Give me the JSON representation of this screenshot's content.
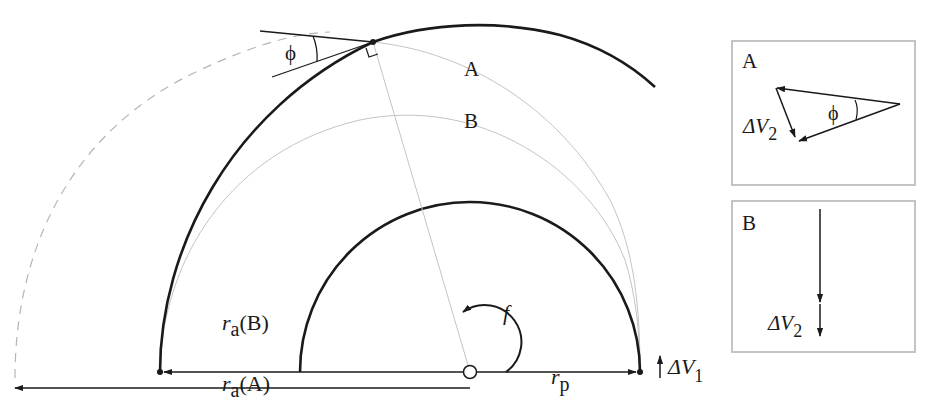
{
  "diagram": {
    "type": "orbital-transfer",
    "labels": {
      "phi": "ϕ",
      "orbit_A": "A",
      "orbit_B": "B",
      "true_anomaly": "f",
      "r_p_main": "r",
      "r_p_sub": "p",
      "r_aB_main": "r",
      "r_aB_sub": "a",
      "r_aB_suffix": "(B)",
      "r_aA_main": "r",
      "r_aA_sub": "a",
      "r_aA_suffix": "(A)",
      "dv1_main": "ΔV",
      "dv1_sub": "1",
      "dv2_main": "ΔV",
      "dv2_sub": "2"
    },
    "inset_A": {
      "title": "A",
      "phi": "ϕ",
      "dv_main": "ΔV",
      "dv_sub": "2"
    },
    "inset_B": {
      "title": "B",
      "dv_main": "ΔV",
      "dv_sub": "2"
    },
    "colors": {
      "ink": "#1a1a1a",
      "thin_gray": "#bdbdbd",
      "dashed_gray": "#b5b5b5",
      "inset_border": "#c4c4c4"
    }
  }
}
